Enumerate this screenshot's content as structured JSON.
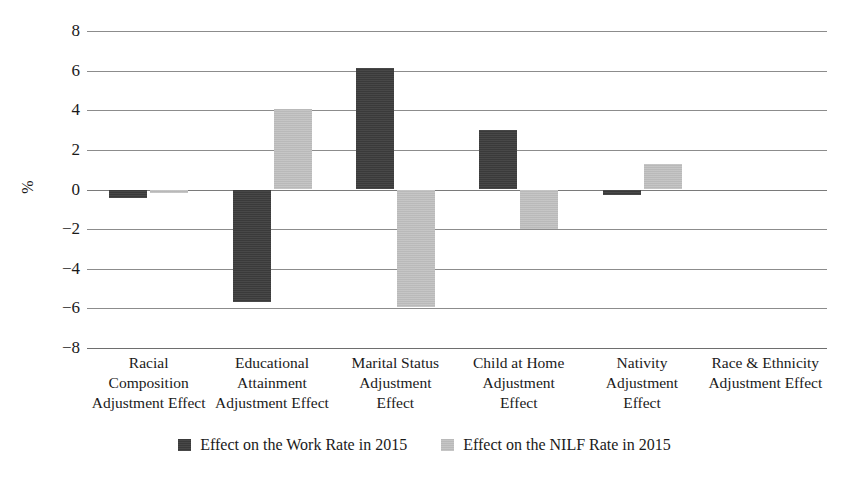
{
  "chart_data": {
    "type": "bar",
    "title": "",
    "xlabel": "",
    "ylabel": "%",
    "ylim": [
      -8,
      8
    ],
    "yticks": [
      "8",
      "6",
      "4",
      "2",
      "0",
      "−2",
      "−4",
      "−6",
      "−8"
    ],
    "ytick_values": [
      8,
      6,
      4,
      2,
      0,
      -2,
      -4,
      -6,
      -8
    ],
    "grid": true,
    "legend_position": "bottom-center",
    "categories": [
      "Racial Composition Adjustment Effect",
      "Educational Attainment Adjustment Effect",
      "Marital Status Adjustment Effect",
      "Child at Home Adjustment Effect",
      "Nativity Adjustment Effect",
      "Race & Ethnicity Adjustment Effect"
    ],
    "category_lines": [
      [
        "Racial",
        "Composition",
        "Adjustment Effect"
      ],
      [
        "Educational",
        "Attainment",
        "Adjustment Effect"
      ],
      [
        "Marital Status",
        "Adjustment",
        "Effect"
      ],
      [
        "Child at Home",
        "Adjustment",
        "Effect"
      ],
      [
        "Nativity",
        "Adjustment",
        "Effect"
      ],
      [
        "Race & Ethnicity",
        "Adjustment Effect"
      ]
    ],
    "series": [
      {
        "name": "Effect on the Work Rate in 2015",
        "color": "#3a3a3a",
        "values": [
          -0.45,
          -5.7,
          6.15,
          2.98,
          -0.3,
          0
        ]
      },
      {
        "name": "Effect on the NILF Rate in 2015",
        "color": "#b9b9b9",
        "values": [
          -0.2,
          4.05,
          -5.95,
          -1.97,
          1.3,
          0
        ]
      }
    ]
  },
  "legend": {
    "items": [
      {
        "label": "Effect on the Work Rate in 2015",
        "swatch": "dark"
      },
      {
        "label": "Effect on the NILF Rate in 2015",
        "swatch": "light"
      }
    ]
  },
  "axis": {
    "y_title": "%"
  }
}
